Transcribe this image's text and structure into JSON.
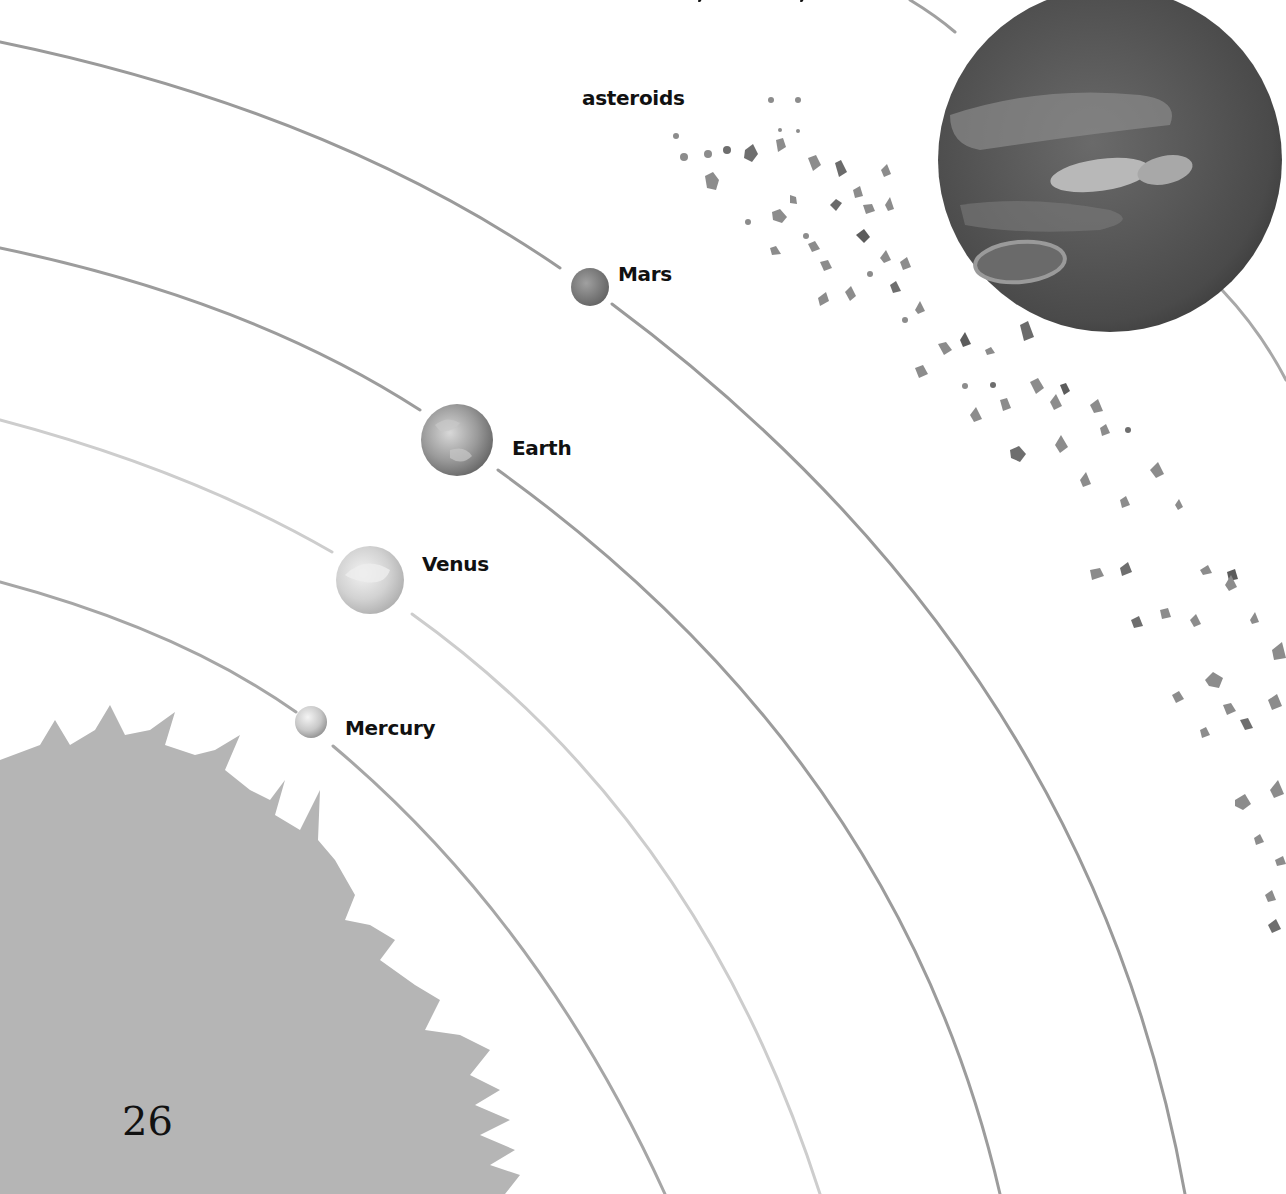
{
  "diagram": {
    "labels": {
      "asteroids": "asteroids",
      "mars": "Mars",
      "earth": "Earth",
      "venus": "Venus",
      "mercury": "Mercury"
    },
    "page_number": "26",
    "bodies": [
      {
        "name": "Mercury",
        "cx": 311,
        "cy": 722,
        "r": 16
      },
      {
        "name": "Venus",
        "cx": 370,
        "cy": 580,
        "r": 34
      },
      {
        "name": "Earth",
        "cx": 457,
        "cy": 440,
        "r": 36
      },
      {
        "name": "Mars",
        "cx": 590,
        "cy": 287,
        "r": 19
      },
      {
        "name": "Jupiter",
        "cx": 1110,
        "cy": 160,
        "r": 172
      }
    ],
    "colors": {
      "background": "#ffffff",
      "orbit_dark": "#9a9a9a",
      "orbit_light": "#c4c4c4",
      "sun": "#b3b3b3",
      "jupiter": "#4a4a4a",
      "asteroid": "#8a8a8a",
      "text": "#111111"
    }
  }
}
